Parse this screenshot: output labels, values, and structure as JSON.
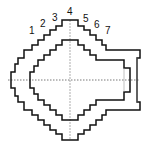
{
  "diagram": {
    "type": "stepped cross-section",
    "step_labels": [
      "1",
      "2",
      "3",
      "4",
      "5",
      "6",
      "7"
    ],
    "colors": {
      "outline": "#111111",
      "centerline": "#555555",
      "background": "#ffffff"
    }
  }
}
